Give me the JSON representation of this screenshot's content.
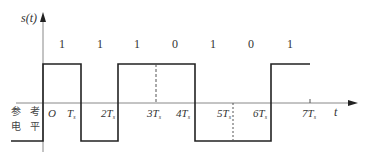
{
  "diagram": {
    "y_axis_label": "s(t)",
    "x_axis_label": "t",
    "reference_label": [
      "参 考",
      "电 平"
    ],
    "origin_label": "O",
    "bits": [
      "1",
      "1",
      "1",
      "0",
      "1",
      "0",
      "1"
    ],
    "ticks": [
      {
        "n": "",
        "sub": "s",
        "base": "T"
      },
      {
        "n": "2",
        "sub": "s",
        "base": "T"
      },
      {
        "n": "3",
        "sub": "s",
        "base": "T"
      },
      {
        "n": "4",
        "sub": "s",
        "base": "T"
      },
      {
        "n": "5",
        "sub": "s",
        "base": "T"
      },
      {
        "n": "6",
        "sub": "s",
        "base": "T"
      },
      {
        "n": "7",
        "sub": "s",
        "base": "T"
      }
    ],
    "tick_text": [
      "T",
      "2T",
      "3T",
      "4T",
      "5T",
      "6T",
      "7T"
    ],
    "subscript": "s",
    "colors": {
      "line": "#222222",
      "axis": "#777777",
      "dash": "#555555"
    }
  }
}
